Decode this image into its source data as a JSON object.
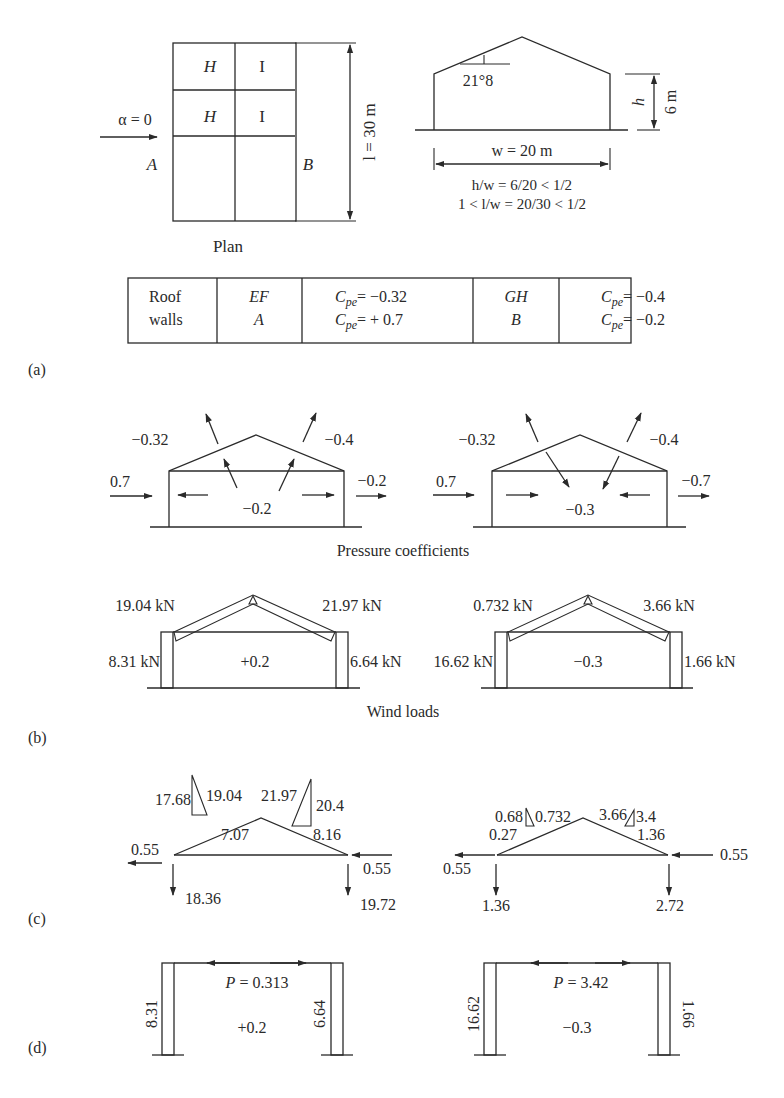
{
  "panel_labels": {
    "a": "(a)",
    "b": "(b)",
    "c": "(c)",
    "d": "(d)"
  },
  "plan": {
    "wind_label": "α = 0",
    "zone_labels": [
      "H",
      "I",
      "H",
      "I"
    ],
    "face_a": "A",
    "face_b": "B",
    "length_label": "l = 30 m",
    "caption": "Plan"
  },
  "elevation": {
    "angle_label": "21°8",
    "height_var": "h",
    "height_value": "6 m",
    "width_label": "w = 20 m",
    "ratio_1": "h/w = 6/20 < 1/2",
    "ratio_2": "1 < l/w = 20/30 < 1/2"
  },
  "coeff_table": {
    "rows": [
      {
        "element": "Roof",
        "zone1": "EF",
        "cpe1": "= −0.32",
        "zone2": "GH",
        "cpe2": "= −0.4"
      },
      {
        "element": "walls",
        "zone1": "A",
        "cpe1": "= + 0.7",
        "zone2": "B",
        "cpe2": "= −0.2"
      }
    ],
    "cpe_symbol": "C",
    "cpe_sub": "pe"
  },
  "pressure_coefficients": {
    "caption": "Pressure coefficients",
    "case1": {
      "windward_wall": "0.7",
      "leeward_wall": "−0.2",
      "roof_left": "−0.32",
      "roof_right": "−0.4",
      "internal": "−0.2"
    },
    "case2": {
      "windward_wall": "0.7",
      "leeward_wall": "−0.7",
      "roof_left": "−0.32",
      "roof_right": "−0.4",
      "internal": "−0.3"
    }
  },
  "wind_loads": {
    "caption": "Wind loads",
    "case1": {
      "roof_left": "19.04 kN",
      "roof_right": "21.97 kN",
      "wall_left": "8.31 kN",
      "wall_right": "6.64 kN",
      "internal": "+0.2"
    },
    "case2": {
      "roof_left": "0.732 kN",
      "roof_right": "3.66 kN",
      "wall_left": "16.62 kN",
      "wall_right": "1.66 kN",
      "internal": "−0.3"
    }
  },
  "truss_forces": {
    "case1": {
      "left_h": "17.68",
      "left_total": "19.04",
      "right_total": "21.97",
      "right_v": "20.4",
      "left_n": "7.07",
      "right_n": "8.16",
      "horiz_left": "0.55",
      "horiz_right": "0.55",
      "react_left": "18.36",
      "react_right": "19.72"
    },
    "case2": {
      "left_h": "0.68",
      "left_total": "0.732",
      "right_total": "3.66",
      "right_v": "3.4",
      "left_n": "0.27",
      "right_n": "1.36",
      "horiz_left": "0.55",
      "horiz_right": "0.55",
      "react_left": "1.36",
      "react_right": "2.72"
    }
  },
  "frames": {
    "case1": {
      "p_label": "P = 0.313",
      "left": "8.31",
      "right": "6.64",
      "internal": "+0.2"
    },
    "case2": {
      "p_label": "P = 3.42",
      "left": "16.62",
      "right": "1.66",
      "internal": "−0.3"
    }
  }
}
